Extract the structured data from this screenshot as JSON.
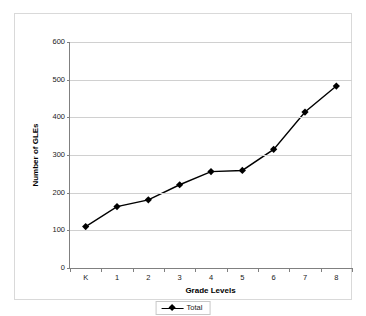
{
  "chart_data": {
    "type": "line",
    "title": "",
    "xlabel": "Grade Levels",
    "ylabel": "Number of GLEs",
    "categories": [
      "K",
      "1",
      "2",
      "3",
      "4",
      "5",
      "6",
      "7",
      "8"
    ],
    "series": [
      {
        "name": "Total",
        "values": [
          110,
          163,
          181,
          221,
          256,
          259,
          315,
          414,
          483
        ],
        "color": "#000000",
        "marker": "diamond"
      }
    ],
    "ylim": [
      0,
      600
    ],
    "yticks": [
      0,
      100,
      200,
      300,
      400,
      500,
      600
    ],
    "ytick_labels": [
      "0",
      "100",
      "200",
      "300",
      "400",
      "500",
      "600"
    ],
    "grid": true,
    "grid_axis": "y",
    "legend": [
      "Total"
    ],
    "legend_position": "bottom",
    "plot_background": "#ffffff",
    "gridline_color": "#d0d0d0",
    "axis_color": "#808080"
  },
  "legend": {
    "entry_label": "Total"
  }
}
